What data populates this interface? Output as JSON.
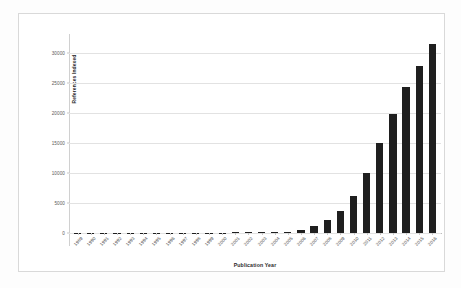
{
  "chart_data": {
    "type": "bar",
    "title": "",
    "xlabel": "Publication Year",
    "ylabel": "References Indexed",
    "categories": [
      "1989",
      "1990",
      "1991",
      "1992",
      "1993",
      "1994",
      "1995",
      "1996",
      "1997",
      "1998",
      "1999",
      "2000",
      "2001",
      "2002",
      "2003",
      "2004",
      "2005",
      "2006",
      "2007",
      "2008",
      "2009",
      "2010",
      "2011",
      "2012",
      "2013",
      "2014",
      "2015",
      "2016"
    ],
    "values": [
      20,
      15,
      18,
      20,
      22,
      25,
      30,
      35,
      40,
      45,
      55,
      70,
      90,
      110,
      140,
      180,
      230,
      420,
      1150,
      2150,
      3650,
      6250,
      10050,
      14950,
      19900,
      24300,
      27900,
      31500
    ],
    "ylim": [
      0,
      32000
    ],
    "yticks": [
      0,
      5000,
      10000,
      15000,
      20000,
      25000,
      30000
    ],
    "ytick_labels": [
      "0",
      "5000",
      "10000",
      "15000",
      "20000",
      "25000",
      "30000"
    ],
    "grid": "horizontal",
    "legend": "none",
    "bar_color": "#1f1f1f",
    "gridline_color": "#e2e2e2",
    "background_color": "#ffffff",
    "frame_color": "#d9d9d9",
    "xlabel_rotation": -47
  }
}
